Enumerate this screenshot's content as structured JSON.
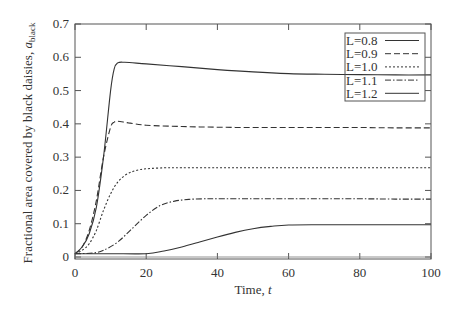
{
  "chart_data": {
    "type": "line",
    "title": "",
    "xlabel": "Time, t",
    "ylabel": "Fractional area covered by black daisies, a_black",
    "ylabel_main": "Fractional area covered by black daisies, ",
    "ylabel_symbol": "a",
    "ylabel_subscript": "black",
    "xlabel_main": "Time, ",
    "xlabel_symbol": "t",
    "xlim": [
      0,
      100
    ],
    "ylim": [
      0,
      0.7
    ],
    "xticks": [
      0,
      20,
      40,
      60,
      80,
      100
    ],
    "yticks": [
      0,
      0.1,
      0.2,
      0.3,
      0.4,
      0.5,
      0.6,
      0.7
    ],
    "xtick_labels": [
      "0",
      "20",
      "40",
      "60",
      "80",
      "100"
    ],
    "ytick_labels": [
      "0",
      "0.1",
      "0.2",
      "0.3",
      "0.4",
      "0.5",
      "0.6",
      "0.7"
    ],
    "grid": false,
    "legend_position": "upper right",
    "series": [
      {
        "name": "L=0.8",
        "style": "solid",
        "x": [
          0,
          2,
          4,
          6,
          8,
          10,
          11,
          12,
          14,
          20,
          30,
          40,
          50,
          60,
          70,
          80,
          90,
          100
        ],
        "y": [
          0.01,
          0.03,
          0.07,
          0.15,
          0.3,
          0.5,
          0.565,
          0.583,
          0.585,
          0.58,
          0.572,
          0.563,
          0.556,
          0.551,
          0.549,
          0.548,
          0.547,
          0.547
        ]
      },
      {
        "name": "L=0.9",
        "style": "dashed",
        "x": [
          0,
          2,
          4,
          6,
          8,
          10,
          11,
          12,
          15,
          20,
          30,
          40,
          50,
          60,
          70,
          80,
          90,
          100
        ],
        "y": [
          0.01,
          0.03,
          0.08,
          0.17,
          0.3,
          0.39,
          0.405,
          0.408,
          0.403,
          0.396,
          0.392,
          0.39,
          0.389,
          0.389,
          0.389,
          0.389,
          0.388,
          0.388
        ]
      },
      {
        "name": "L=1.0",
        "style": "dotted",
        "x": [
          0,
          2,
          4,
          6,
          8,
          10,
          12,
          14,
          16,
          18,
          20,
          25,
          30,
          40,
          50,
          60,
          70,
          80,
          90,
          100
        ],
        "y": [
          0.01,
          0.02,
          0.04,
          0.08,
          0.14,
          0.19,
          0.225,
          0.245,
          0.256,
          0.262,
          0.265,
          0.268,
          0.268,
          0.268,
          0.268,
          0.268,
          0.268,
          0.268,
          0.268,
          0.268
        ]
      },
      {
        "name": "L=1.1",
        "style": "dashdot",
        "x": [
          0,
          5,
          8,
          12,
          16,
          20,
          24,
          28,
          32,
          36,
          40,
          50,
          60,
          70,
          80,
          90,
          100
        ],
        "y": [
          0.01,
          0.012,
          0.02,
          0.045,
          0.085,
          0.125,
          0.155,
          0.168,
          0.173,
          0.175,
          0.175,
          0.175,
          0.175,
          0.175,
          0.175,
          0.174,
          0.174
        ]
      },
      {
        "name": "L=1.2",
        "style": "solid",
        "x": [
          0,
          10,
          20,
          25,
          30,
          35,
          40,
          45,
          50,
          55,
          60,
          70,
          80,
          90,
          100
        ],
        "y": [
          0.01,
          0.01,
          0.01,
          0.018,
          0.03,
          0.045,
          0.06,
          0.074,
          0.085,
          0.092,
          0.096,
          0.097,
          0.097,
          0.097,
          0.097
        ]
      }
    ]
  },
  "legend": {
    "items": [
      {
        "label": "L=0.8",
        "style": "solid"
      },
      {
        "label": "L=0.9",
        "style": "dashed"
      },
      {
        "label": "L=1.0",
        "style": "dotted"
      },
      {
        "label": "L=1.1",
        "style": "dashdot"
      },
      {
        "label": "L=1.2",
        "style": "solid"
      }
    ]
  },
  "colors": {
    "line": "#333333",
    "frame": "#555555",
    "background": "#ffffff"
  }
}
